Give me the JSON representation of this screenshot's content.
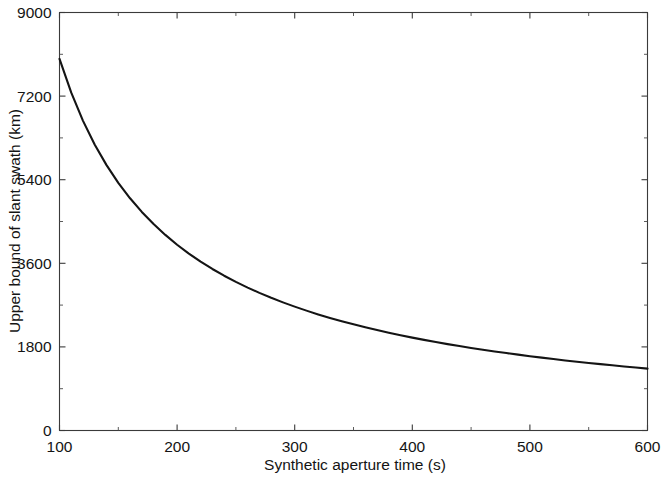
{
  "chart_data": {
    "type": "line",
    "title": "",
    "xlabel": "Synthetic aperture time (s)",
    "ylabel": "Upper bound of slant swath (km)",
    "xlim": [
      100,
      600
    ],
    "ylim": [
      0,
      9000
    ],
    "xticks": [
      100,
      200,
      300,
      400,
      500,
      600
    ],
    "xtick_labels": [
      "100",
      "200",
      "300",
      "400",
      "500",
      "600"
    ],
    "yticks": [
      0,
      1800,
      3600,
      5400,
      7200,
      9000
    ],
    "ytick_labels": [
      "0",
      "1800",
      "3600",
      "5400",
      "7200",
      "9000"
    ],
    "y_minor_step": 900,
    "grid": false,
    "legend": null,
    "line_color": "#141414",
    "axis_color": "#3a3a3a",
    "background_color": "#ffffff",
    "series": [
      {
        "name": "Upper bound of slant swath",
        "x": [
          100,
          110,
          120,
          130,
          140,
          150,
          160,
          170,
          180,
          190,
          200,
          210,
          220,
          230,
          240,
          250,
          260,
          270,
          280,
          290,
          300,
          310,
          320,
          330,
          340,
          350,
          360,
          370,
          380,
          390,
          400,
          410,
          420,
          430,
          440,
          450,
          460,
          470,
          480,
          490,
          500,
          510,
          520,
          530,
          540,
          550,
          560,
          570,
          580,
          590,
          600
        ],
        "values": [
          8000,
          7273,
          6667,
          6154,
          5714,
          5333,
          5000,
          4706,
          4444,
          4211,
          4000,
          3810,
          3636,
          3478,
          3333,
          3200,
          3077,
          2963,
          2857,
          2759,
          2667,
          2581,
          2500,
          2424,
          2353,
          2286,
          2222,
          2162,
          2105,
          2051,
          2000,
          1951,
          1905,
          1860,
          1818,
          1778,
          1739,
          1702,
          1667,
          1633,
          1600,
          1569,
          1538,
          1509,
          1481,
          1455,
          1429,
          1404,
          1379,
          1356,
          1333
        ]
      }
    ]
  }
}
